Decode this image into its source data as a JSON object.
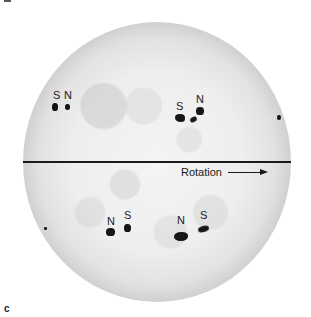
{
  "figure": {
    "panel_label": "c",
    "rotation_label": "Rotation",
    "equator_line": true
  },
  "sunspot_groups": [
    {
      "hemisphere": "northern",
      "position": "upper-left",
      "labels": [
        {
          "text": "S",
          "x": 53,
          "y": 90
        },
        {
          "text": "N",
          "x": 64,
          "y": 90
        }
      ]
    },
    {
      "hemisphere": "northern",
      "position": "upper-right",
      "labels": [
        {
          "text": "S",
          "x": 176,
          "y": 101
        },
        {
          "text": "N",
          "x": 196,
          "y": 94
        }
      ]
    },
    {
      "hemisphere": "southern",
      "position": "lower-left",
      "labels": [
        {
          "text": "N",
          "x": 107,
          "y": 216
        },
        {
          "text": "S",
          "x": 124,
          "y": 210
        }
      ]
    },
    {
      "hemisphere": "southern",
      "position": "lower-right",
      "labels": [
        {
          "text": "N",
          "x": 177,
          "y": 215
        },
        {
          "text": "S",
          "x": 200,
          "y": 210
        }
      ]
    }
  ],
  "colors": {
    "limb": "#7a7a7a",
    "disc_center": "#f4f4f4",
    "spots": "#161616",
    "text": "#1a1a1a"
  }
}
